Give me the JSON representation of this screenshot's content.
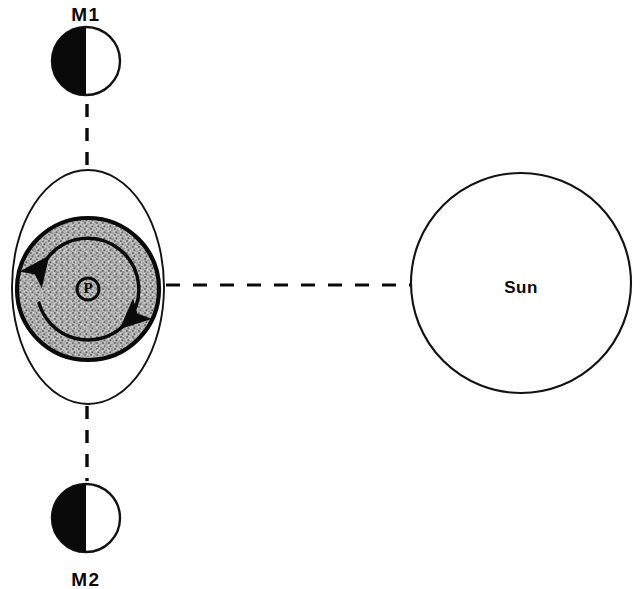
{
  "diagram": {
    "background_color": "#ffffff",
    "ink_color": "#0a0a0a",
    "shade_color": "#a8a8a8",
    "bodies": {
      "moon_upper": {
        "label": "M1",
        "icon": "half-shaded-circle",
        "cx": 86,
        "cy": 61,
        "r": 34,
        "shaded_side": "left",
        "label_x": 86,
        "label_y": 16
      },
      "moon_lower": {
        "label": "M2",
        "icon": "half-shaded-circle",
        "cx": 86,
        "cy": 518,
        "r": 34,
        "shaded_side": "left",
        "label_x": 86,
        "label_y": 581
      },
      "sun": {
        "label": "Sun",
        "icon": "sun-circle",
        "cx": 521,
        "cy": 283,
        "r": 110,
        "label_x": 521,
        "label_y": 289
      },
      "planet": {
        "label": "P",
        "icon": "planet-symbol",
        "cx": 88,
        "cy": 289,
        "r": 11
      }
    },
    "shells": {
      "outer_ellipse": {
        "name": "outer-orbit-ellipse",
        "cx": 88,
        "cy": 287,
        "rx": 76,
        "ry": 117
      },
      "shaded_disc": {
        "name": "shaded-atmosphere-disc",
        "cx": 88,
        "cy": 289,
        "r": 71
      },
      "inner_orbit": {
        "name": "inner-orbit-circle",
        "cx": 88,
        "cy": 289,
        "r": 51,
        "direction": "counterclockwise",
        "arrow_count": 2
      }
    },
    "connectors": [
      {
        "name": "dashed-line-m1-to-planet",
        "orientation": "vertical",
        "x1": 87,
        "y1": 104,
        "x2": 87,
        "y2": 172
      },
      {
        "name": "dashed-line-planet-to-m2",
        "orientation": "vertical",
        "x1": 87,
        "y1": 406,
        "x2": 87,
        "y2": 481
      },
      {
        "name": "dashed-line-planet-to-sun",
        "orientation": "horizontal",
        "x1": 166,
        "y1": 285,
        "x2": 412,
        "y2": 285
      }
    ]
  }
}
